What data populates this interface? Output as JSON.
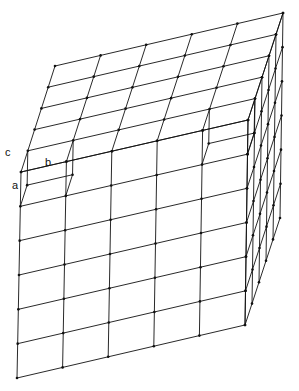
{
  "figure": {
    "labels": {
      "a": "a",
      "b": "b",
      "c": "c"
    },
    "grid": {
      "top_cols": 5,
      "top_rows": 5,
      "front_cols": 5,
      "front_rows": 6,
      "side_cols": 5
    },
    "corners": {
      "front_top_left": [
        21,
        172
      ],
      "front_top_right": [
        248,
        120
      ],
      "front_bottom_left": [
        17,
        378
      ],
      "front_bottom_right": [
        245,
        325
      ],
      "back_top_left": [
        55,
        66
      ],
      "back_top_right": [
        283,
        13
      ]
    },
    "line_color": "#111111"
  }
}
